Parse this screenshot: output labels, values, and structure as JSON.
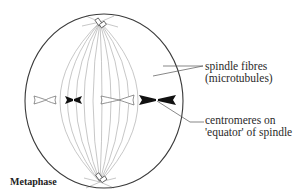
{
  "diagram": {
    "title": "Metaphase",
    "labels": {
      "spindle_fibres": [
        "spindle fibres",
        "(microtubules)"
      ],
      "centromeres": [
        "centromeres on",
        "'equator' of spindle"
      ]
    },
    "colors": {
      "outline": "#3a3a3a",
      "fibre": "#b8b8b8",
      "chromosome_dark": "#111111",
      "chromosome_light": "#ffffff",
      "text": "#2a2a2a"
    }
  }
}
